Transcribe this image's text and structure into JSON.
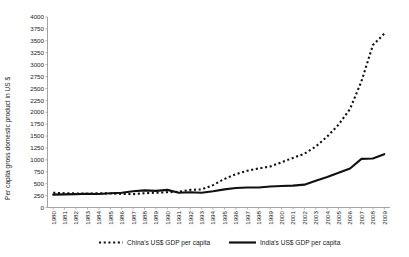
{
  "chart_data": {
    "type": "line",
    "title": "",
    "xlabel": "",
    "ylabel": "Per capita gross domestic product in US $",
    "ylim": [
      0,
      4000
    ],
    "ytick_step": 250,
    "yticks": [
      0,
      250,
      500,
      750,
      1000,
      1250,
      1500,
      1750,
      2000,
      2250,
      2500,
      2750,
      3000,
      3250,
      3500,
      3750,
      4000
    ],
    "ytick_labels": [
      "0",
      "250",
      "500",
      "750",
      "1000",
      "1250",
      "1500",
      "1750",
      "2000",
      "2250",
      "2500",
      "2750",
      "3000",
      "3250",
      "3500",
      "3750",
      "4000"
    ],
    "grid": false,
    "legend_position": "bottom",
    "categories": [
      "1980",
      "1981",
      "1982",
      "1983",
      "1984",
      "1985",
      "1986",
      "1987",
      "1988",
      "1989",
      "1990",
      "1991",
      "1992",
      "1993",
      "1994",
      "1995",
      "1996",
      "1997",
      "1998",
      "1999",
      "2000",
      "2001",
      "2002",
      "2003",
      "2004",
      "2005",
      "2006",
      "2007",
      "2008",
      "2009"
    ],
    "series": [
      {
        "name": "China's US$ GDP per capita",
        "style": "dashed",
        "color": "#111111",
        "values": [
          310,
          300,
          295,
          290,
          300,
          295,
          285,
          280,
          300,
          310,
          320,
          330,
          370,
          380,
          470,
          600,
          700,
          770,
          820,
          860,
          950,
          1040,
          1130,
          1280,
          1490,
          1740,
          2070,
          2650,
          3410,
          3650
        ]
      },
      {
        "name": "India's US$ GDP per capita",
        "style": "solid",
        "color": "#111111",
        "values": [
          270,
          275,
          280,
          290,
          285,
          300,
          310,
          340,
          360,
          350,
          370,
          310,
          320,
          310,
          340,
          380,
          410,
          420,
          420,
          440,
          450,
          460,
          480,
          560,
          640,
          730,
          820,
          1020,
          1030,
          1120
        ]
      }
    ],
    "legend": [
      {
        "label": "China's US$ GDP per capita",
        "style": "dashed"
      },
      {
        "label": "India's US$ GDP per capita",
        "style": "solid"
      }
    ]
  }
}
